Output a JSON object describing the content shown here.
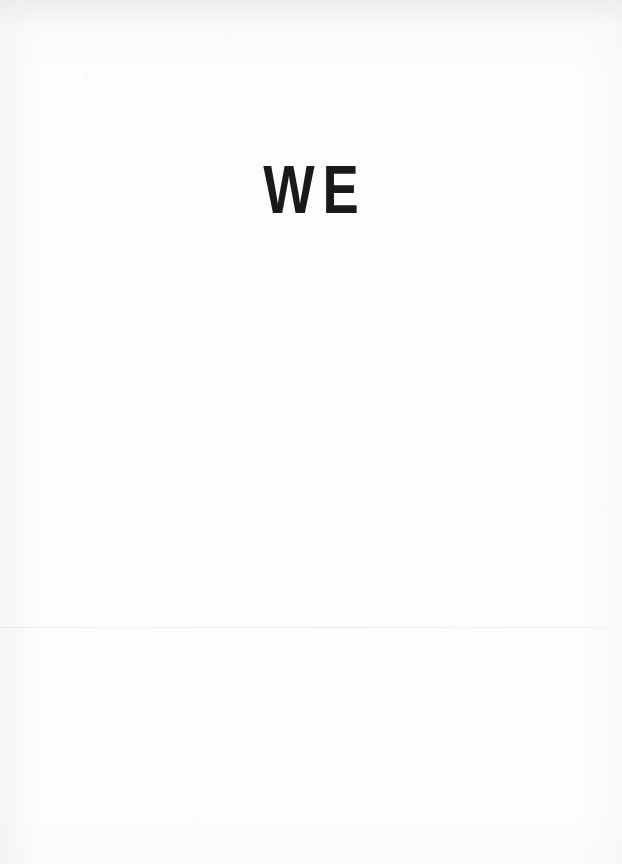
{
  "page": {
    "width": 622,
    "height": 864,
    "background_color": "#fdfdfd",
    "kind": "scanned-book-page"
  },
  "content": {
    "headline": "WE",
    "headline_color": "#1a1a1a"
  },
  "marks": {
    "fold_line_color": "#ececef",
    "fold_line_label": "fold-crease-line"
  }
}
